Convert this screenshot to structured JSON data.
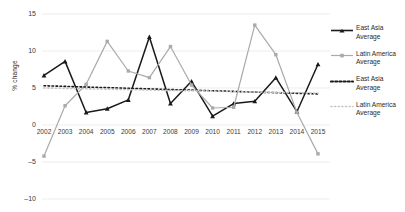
{
  "chart_data": {
    "type": "line",
    "title": "",
    "xlabel": "",
    "ylabel": "% change",
    "ylim": [
      -10,
      15
    ],
    "yticks": [
      15,
      10,
      5,
      0,
      -5,
      -10
    ],
    "grid": true,
    "legend_position": "right",
    "categories": [
      "2002",
      "2003",
      "2004",
      "2005",
      "2006",
      "2007",
      "2008",
      "2009",
      "2010",
      "2011",
      "2012",
      "2013",
      "2014",
      "2015"
    ],
    "series": [
      {
        "name": "East Asia Average",
        "style": "solid",
        "marker": "triangle",
        "color": "#1a1a1a",
        "values": [
          6.7,
          8.6,
          1.7,
          2.2,
          3.4,
          11.9,
          2.9,
          5.9,
          1.2,
          2.9,
          3.2,
          6.4,
          1.8,
          8.2
        ]
      },
      {
        "name": "Latin America Average",
        "style": "solid",
        "marker": "square",
        "color": "#aaaaaa",
        "values": [
          -4.2,
          2.6,
          5.5,
          11.3,
          7.3,
          6.4,
          10.6,
          5.4,
          2.3,
          2.4,
          13.5,
          9.5,
          1.7,
          -3.9
        ]
      },
      {
        "name": "East Asia Average",
        "style": "dotted",
        "marker": "none",
        "color": "#1a1a1a",
        "values": [
          5.3,
          5.22,
          5.13,
          5.05,
          4.96,
          4.88,
          4.79,
          4.71,
          4.62,
          4.54,
          4.45,
          4.37,
          4.28,
          4.2
        ]
      },
      {
        "name": "Latin America Average",
        "style": "dotted",
        "marker": "none",
        "color": "#c4c4c4",
        "values": [
          5.0,
          4.95,
          4.89,
          4.84,
          4.78,
          4.73,
          4.67,
          4.62,
          4.57,
          4.51,
          4.46,
          4.4,
          4.35,
          4.3
        ]
      }
    ]
  },
  "legend": {
    "items": [
      {
        "label_line1": "East Asia",
        "label_line2": "Average",
        "style": "solid-triangle",
        "color": "#1a1a1a"
      },
      {
        "label_line1": "Latin America",
        "label_line2": "Average",
        "style": "solid-square",
        "color": "#aaaaaa"
      },
      {
        "label_line1": "East Asia",
        "label_line2": "Average",
        "style": "dotted",
        "color": "#1a1a1a"
      },
      {
        "label_line1": "Latin America",
        "label_line2": "Average",
        "style": "dotted",
        "color": "#c4c4c4"
      }
    ]
  },
  "axis": {
    "y_title": "% change"
  }
}
